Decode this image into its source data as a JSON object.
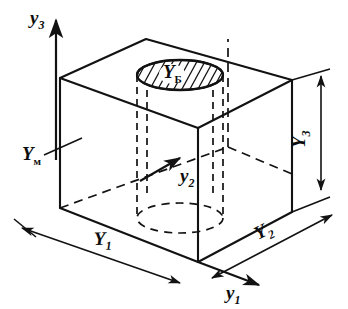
{
  "figure": {
    "background_color": "#ffffff",
    "line_color": "#121212"
  },
  "axes": [
    {
      "id": "y3",
      "name": "vertical-axis",
      "label": "y",
      "subscript": "3",
      "direction": "up",
      "label_position": {
        "x": 30,
        "y": 22
      }
    },
    {
      "id": "y2",
      "name": "depth-axis",
      "label": "y",
      "subscript": "2",
      "direction": "up-right",
      "label_position": {
        "x": 180,
        "y": 178
      }
    },
    {
      "id": "y1",
      "name": "width-axis",
      "label": "y",
      "subscript": "1",
      "direction": "right-down",
      "label_position": {
        "x": 228,
        "y": 297
      }
    }
  ],
  "dimensions": [
    {
      "id": "Y1",
      "name": "width-dimension",
      "label": "Y",
      "subscript": "1",
      "orientation": "bottom-front-left",
      "label_position": {
        "x": 97,
        "y": 243
      }
    },
    {
      "id": "Y2",
      "name": "depth-dimension",
      "label": "Y",
      "subscript": "2",
      "orientation": "bottom-front-right",
      "label_position": {
        "x": 263,
        "y": 236
      }
    },
    {
      "id": "Y3",
      "name": "height-dimension",
      "label": "Y",
      "subscript": "3",
      "orientation": "right-vertical-rotated",
      "label_position": {
        "x": 310,
        "y": 142
      }
    }
  ],
  "callouts": [
    {
      "id": "Ym",
      "name": "material-callout",
      "label": "Y",
      "subscript": "м",
      "target": "left-face-of-body",
      "label_position": {
        "x": 27,
        "y": 160
      }
    },
    {
      "id": "Yb",
      "name": "bore-callout",
      "label": "Y",
      "subscript": "Б",
      "target": "hatched-bore-opening",
      "label_position": {
        "x": 163,
        "y": 80
      }
    }
  ],
  "geometry": {
    "body_type": "rectangular-parallelepiped",
    "feature": "cylindrical-through-bore",
    "bore_top_face": "hatched-ellipse",
    "hidden_lines": "dashed"
  }
}
